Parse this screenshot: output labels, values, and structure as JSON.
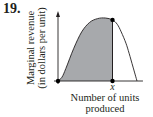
{
  "problem_number": "19.",
  "chart_data": {
    "type": "area",
    "title": "",
    "xlabel": "Number of units produced",
    "ylabel_lines": [
      "Marginal revenue",
      "(in dollars per unit)"
    ],
    "x_tick_labels": [
      {
        "at": 0.69,
        "label": "x"
      }
    ],
    "xlim": [
      0,
      1.05
    ],
    "ylim": [
      0,
      1.1
    ],
    "curve": {
      "x": [
        0,
        0.05,
        0.1,
        0.2,
        0.3,
        0.4,
        0.5,
        0.6,
        0.69,
        0.75,
        0.8,
        0.86,
        0.9,
        0.95,
        1.0
      ],
      "y": [
        0,
        0.06,
        0.2,
        0.52,
        0.78,
        0.93,
        0.99,
        1.0,
        0.97,
        0.9,
        0.78,
        0.6,
        0.44,
        0.22,
        0
      ]
    },
    "shaded_region": {
      "from": 0,
      "to": 0.69,
      "fill": "#a7a9ac"
    },
    "marked_points": [
      {
        "x": 0,
        "y": 0
      },
      {
        "x": 0.69,
        "y": 0
      },
      {
        "x": 0.69,
        "y": 0.97
      }
    ],
    "grid": false,
    "legend": "none"
  }
}
